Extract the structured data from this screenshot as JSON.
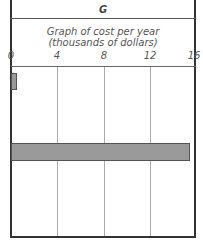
{
  "header": {
    "label": "G"
  },
  "chart_data": {
    "type": "bar",
    "orientation": "horizontal",
    "title": "Graph of cost per year",
    "subtitle": "(thousands of dollars)",
    "xlabel": "Cost per year (thousands of dollars)",
    "ylabel": "",
    "xlim": [
      0,
      16
    ],
    "x_ticks": [
      "0",
      "4",
      "8",
      "12",
      "16"
    ],
    "grid": true,
    "categories": [
      "Row 1",
      "Row 2",
      "Row 3"
    ],
    "values": [
      0.5,
      15.5,
      0
    ]
  }
}
